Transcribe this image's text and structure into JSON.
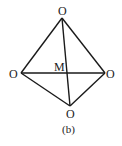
{
  "diagram": {
    "caption": "(b)",
    "center_label": "M",
    "vertex_labels": {
      "top": "O",
      "left": "O",
      "right": "O",
      "bottom": "O"
    },
    "edges": [
      [
        "top",
        "left"
      ],
      [
        "top",
        "right"
      ],
      [
        "left",
        "bottom"
      ],
      [
        "right",
        "bottom"
      ],
      [
        "left",
        "right"
      ],
      [
        "top",
        "bottom"
      ]
    ]
  }
}
